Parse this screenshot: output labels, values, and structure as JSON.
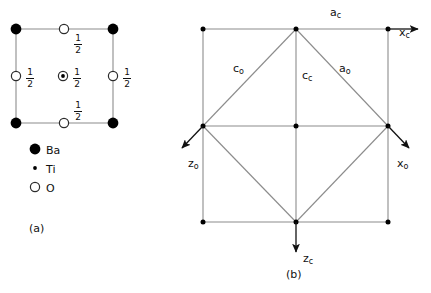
{
  "figure": {
    "panels": [
      {
        "id": "a",
        "caption": "(a)",
        "description": "perovskite unit cell projection"
      },
      {
        "id": "b",
        "caption": "(b)",
        "description": "cubic and orthorhombic cell relationship"
      }
    ]
  },
  "panel_a": {
    "caption": "(a)",
    "legend": [
      {
        "symbol": "filled-circle",
        "label": "Ba"
      },
      {
        "symbol": "small-dot",
        "label": "Ti"
      },
      {
        "symbol": "open-circle",
        "label": "O"
      }
    ],
    "fraction_labels": [
      {
        "id": "top",
        "numerator": "1",
        "denominator": "2"
      },
      {
        "id": "left",
        "numerator": "1",
        "denominator": "2"
      },
      {
        "id": "center",
        "numerator": "1",
        "denominator": "2"
      },
      {
        "id": "right",
        "numerator": "1",
        "denominator": "2"
      },
      {
        "id": "bottom",
        "numerator": "1",
        "denominator": "2"
      }
    ],
    "atoms": {
      "ba_corners": 4,
      "o_edge_midpoints": 4,
      "ti_center": 1
    }
  },
  "panel_b": {
    "caption": "(b)",
    "labels": {
      "a_c": "a",
      "a_c_sub": "c",
      "x_c": "x",
      "x_c_sub": "c",
      "z_c": "z",
      "z_c_sub": "c",
      "x_o": "x",
      "x_o_sub": "o",
      "z_o": "z",
      "z_o_sub": "o",
      "c_o": "c",
      "c_o_sub": "o",
      "c_c": "c",
      "c_c_sub": "c",
      "a_o": "a",
      "a_o_sub": "o"
    },
    "axes": [
      {
        "name": "x_c",
        "direction": "right"
      },
      {
        "name": "z_c",
        "direction": "down"
      },
      {
        "name": "x_o",
        "direction": "down-right"
      },
      {
        "name": "z_o",
        "direction": "down-left"
      }
    ]
  },
  "colors": {
    "line": "#808080",
    "atom_fill": "#000000",
    "atom_stroke": "#333333",
    "background": "#ffffff",
    "text": "#111111"
  }
}
